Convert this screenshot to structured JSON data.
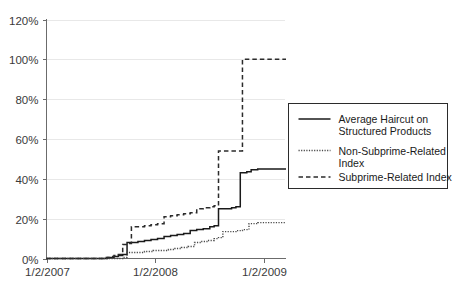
{
  "chart_data": {
    "type": "line",
    "title": "",
    "subtitle": "",
    "xlabel": "",
    "ylabel": "",
    "grid": true,
    "legend_position": "right-middle",
    "ylim": [
      0,
      120
    ],
    "ytick_labels": [
      "120%",
      "100%",
      "80%",
      "60%",
      "40%",
      "20%",
      "0%"
    ],
    "ytick_values": [
      120,
      100,
      80,
      60,
      40,
      20,
      0
    ],
    "xtick_labels": [
      "1/2/2007",
      "1/2/2008",
      "1/2/2009"
    ],
    "xtick_values": [
      0,
      1,
      2
    ],
    "xlim": [
      0,
      2.2
    ],
    "series": [
      {
        "name": "Average Haircut on Structured Products",
        "style": "solid",
        "color": "#1a1a1a",
        "points": [
          [
            0.0,
            0
          ],
          [
            0.48,
            0
          ],
          [
            0.52,
            0
          ],
          [
            0.56,
            0.5
          ],
          [
            0.62,
            1
          ],
          [
            0.66,
            1.5
          ],
          [
            0.7,
            2
          ],
          [
            0.74,
            8
          ],
          [
            0.8,
            8
          ],
          [
            0.84,
            8.5
          ],
          [
            0.9,
            9
          ],
          [
            0.96,
            9.5
          ],
          [
            1.02,
            10
          ],
          [
            1.08,
            11
          ],
          [
            1.14,
            11.5
          ],
          [
            1.2,
            12
          ],
          [
            1.26,
            12.5
          ],
          [
            1.32,
            14
          ],
          [
            1.38,
            14.5
          ],
          [
            1.44,
            15
          ],
          [
            1.5,
            16
          ],
          [
            1.54,
            16.5
          ],
          [
            1.58,
            25
          ],
          [
            1.64,
            25
          ],
          [
            1.7,
            25.5
          ],
          [
            1.74,
            26
          ],
          [
            1.78,
            43
          ],
          [
            1.84,
            43.5
          ],
          [
            1.88,
            44.5
          ],
          [
            1.94,
            45
          ],
          [
            2.0,
            45
          ],
          [
            2.2,
            45
          ]
        ]
      },
      {
        "name": "Non-Subprime-Related Index",
        "style": "dotted",
        "color": "#4a4a4a",
        "points": [
          [
            0.0,
            0
          ],
          [
            0.6,
            0
          ],
          [
            0.66,
            0
          ],
          [
            0.7,
            0.5
          ],
          [
            0.74,
            3
          ],
          [
            0.82,
            3
          ],
          [
            0.9,
            3.5
          ],
          [
            0.98,
            4
          ],
          [
            1.06,
            4
          ],
          [
            1.12,
            4.5
          ],
          [
            1.18,
            5
          ],
          [
            1.24,
            5.5
          ],
          [
            1.3,
            6
          ],
          [
            1.36,
            8
          ],
          [
            1.42,
            8.5
          ],
          [
            1.48,
            9
          ],
          [
            1.54,
            10
          ],
          [
            1.58,
            10.5
          ],
          [
            1.62,
            13.5
          ],
          [
            1.68,
            13.5
          ],
          [
            1.74,
            14
          ],
          [
            1.8,
            14.5
          ],
          [
            1.86,
            17.5
          ],
          [
            1.94,
            18
          ],
          [
            2.0,
            18
          ],
          [
            2.2,
            18
          ]
        ]
      },
      {
        "name": "Subprime-Related Index",
        "style": "dashed",
        "color": "#2b2b2b",
        "points": [
          [
            0.0,
            0
          ],
          [
            0.44,
            0
          ],
          [
            0.5,
            0
          ],
          [
            0.54,
            0.5
          ],
          [
            0.58,
            1
          ],
          [
            0.62,
            1.5
          ],
          [
            0.66,
            2
          ],
          [
            0.7,
            7
          ],
          [
            0.74,
            7.5
          ],
          [
            0.78,
            16
          ],
          [
            0.84,
            16
          ],
          [
            0.9,
            16.5
          ],
          [
            0.96,
            17
          ],
          [
            1.02,
            17.5
          ],
          [
            1.08,
            21
          ],
          [
            1.14,
            21.5
          ],
          [
            1.2,
            22
          ],
          [
            1.26,
            22.5
          ],
          [
            1.32,
            23
          ],
          [
            1.38,
            25
          ],
          [
            1.44,
            25.5
          ],
          [
            1.5,
            26
          ],
          [
            1.54,
            26.5
          ],
          [
            1.58,
            54
          ],
          [
            1.66,
            54
          ],
          [
            1.74,
            54
          ],
          [
            1.8,
            100
          ],
          [
            1.88,
            100
          ],
          [
            1.96,
            100
          ],
          [
            2.0,
            100
          ],
          [
            2.2,
            100
          ]
        ]
      }
    ]
  },
  "legend": {
    "items": [
      {
        "style": "solid",
        "line1": "Average Haircut on",
        "line2": "Structured Products"
      },
      {
        "style": "dotted",
        "line1": "Non-Subprime-Related",
        "line2": "Index"
      },
      {
        "style": "dashed",
        "line1": "Subprime-Related Index",
        "line2": ""
      }
    ]
  }
}
